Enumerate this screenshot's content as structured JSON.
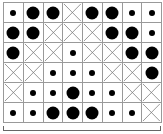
{
  "grid": {
    "columns": 8,
    "rows": 6,
    "legend": {
      "L": "large-dot",
      "S": "small-dot",
      "X": "cross"
    },
    "cells": [
      [
        "S",
        "L",
        "L",
        "X",
        "L",
        "L",
        "S",
        "S"
      ],
      [
        "L",
        "L",
        "X",
        "X",
        "X",
        "L",
        "L",
        "S"
      ],
      [
        "L",
        "X",
        "X",
        "S",
        "X",
        "X",
        "L",
        "L"
      ],
      [
        "X",
        "X",
        "S",
        "S",
        "S",
        "X",
        "X",
        "L"
      ],
      [
        "X",
        "S",
        "S",
        "L",
        "S",
        "S",
        "X",
        "X"
      ],
      [
        "S",
        "S",
        "L",
        "L",
        "L",
        "S",
        "S",
        "X"
      ]
    ]
  },
  "colors": {
    "line": "#999999",
    "mark": "#000000",
    "cross": "#777777"
  }
}
